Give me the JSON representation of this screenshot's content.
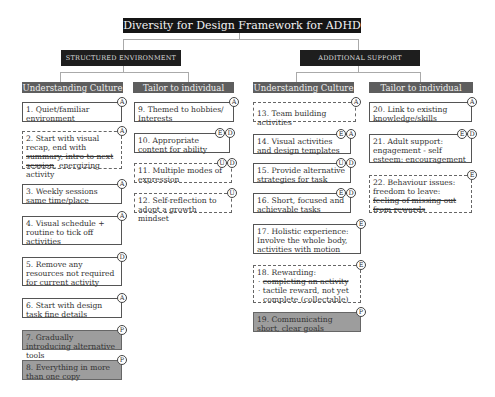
{
  "title": "Diversity for Design Framework for ADHD",
  "categories": [
    {
      "label": "STRUCTURED ENVIRONMENT"
    },
    {
      "label": "ADDITIONAL SUPPORT"
    }
  ],
  "subcategories": [
    {
      "label": "Understanding Culture"
    },
    {
      "label": "Tailor to individual"
    },
    {
      "label": "Understanding Culture"
    },
    {
      "label": "Tailor to individual"
    }
  ],
  "items": {
    "i1": {
      "text": "1. Quiet/familiar environment",
      "badges": [
        "A"
      ]
    },
    "i2": {
      "pre": "2. Start with visual recap, end with ",
      "struck": "summary, intro to next session",
      "post": ", energizing activity",
      "badges": [
        "A"
      ]
    },
    "i3": {
      "text": "3. Weekly sessions same time/place",
      "badges": [
        "A"
      ]
    },
    "i4": {
      "text": "4. Visual schedule + routine to tick off activities",
      "badges": [
        "A"
      ]
    },
    "i5": {
      "text": "5. Remove any resources not required for current activity",
      "badges": [
        "D"
      ]
    },
    "i6": {
      "text": "6. Start with design task fine details",
      "badges": [
        "A"
      ]
    },
    "i7": {
      "text": "7. Gradually introducing alternative tools",
      "badges": [
        "P"
      ]
    },
    "i8": {
      "text": "8. Everything in more than one copy",
      "badges": [
        "P"
      ]
    },
    "i9": {
      "text": "9. Themed to hobbies/ Interests",
      "badges": [
        "A"
      ]
    },
    "i10": {
      "text": "10. Appropriate content for ability",
      "badges": [
        "E",
        "D"
      ]
    },
    "i11": {
      "text": "11. Multiple modes of expression",
      "badges": [
        "U",
        "D"
      ]
    },
    "i12": {
      "text": "12. Self-reflection to adopt a growth mindset",
      "badges": [
        "U"
      ]
    },
    "i13": {
      "text": "13. Team building activities",
      "badges": [
        "A"
      ]
    },
    "i14": {
      "text": "14. Visual activities and design templates",
      "badges": [
        "E",
        "A"
      ]
    },
    "i15": {
      "text": "15. Provide alternative strategies for task",
      "badges": [
        "U",
        "D"
      ]
    },
    "i16": {
      "text": "16. Short, focused and achievable tasks",
      "badges": [
        "E",
        "D"
      ]
    },
    "i17": {
      "text": "17. Holistic experience: Involve the whole body, activities with motion",
      "badges": [
        "E"
      ]
    },
    "i18": {
      "head": "18. Rewarding:",
      "struck": "completing an activity",
      "bullet2": "tactile reward, not yet complete (collectable)",
      "badges": [
        "E"
      ]
    },
    "i19": {
      "text": "19. Communicating short, clear goals",
      "badges": [
        "P"
      ]
    },
    "i20": {
      "text": "20. Link to existing knowledge/skills",
      "badges": [
        "A"
      ]
    },
    "i21": {
      "text": "21. Adult support: engagement - self esteem: encouragement",
      "badges": [
        "E",
        "D"
      ]
    },
    "i22": {
      "pre": "22. Behaviour issues: freedom to leave: ",
      "struck": "feeling of missing out from rewards",
      "badges": [
        "E"
      ]
    }
  }
}
